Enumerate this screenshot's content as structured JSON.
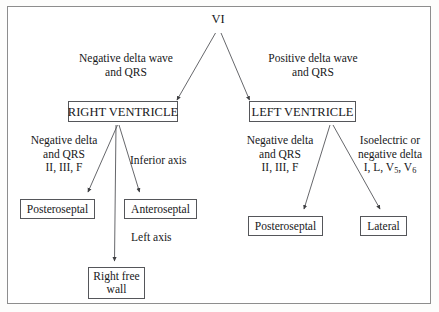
{
  "diagram": {
    "title": "VI",
    "root": {
      "id": "root",
      "label": "VI"
    },
    "level1_edge_labels": {
      "left_line1": "Negative delta wave",
      "left_line2": "and QRS",
      "right_line1": "Positive delta wave",
      "right_line2": "and QRS"
    },
    "level1_nodes": {
      "left": "RIGHT VENTRICLE",
      "right": "LEFT VENTRICLE"
    },
    "rv_branches": {
      "posteroseptal_label_line1": "Negative delta",
      "posteroseptal_label_line2": "and QRS",
      "posteroseptal_label_line3": "II, III, F",
      "anteroseptal_label": "Inferior axis",
      "right_free_wall_label": "Left axis"
    },
    "lv_branches": {
      "posteroseptal_label_line1": "Negative delta",
      "posteroseptal_label_line2": "and QRS",
      "posteroseptal_label_line3": "II, III, F",
      "lateral_label_line1": "Isoelectric or",
      "lateral_label_line2": "negative delta",
      "lateral_label_line3_pre": "I, L, V",
      "lateral_label_line3_sub1": "5",
      "lateral_label_line3_mid": ", V",
      "lateral_label_line3_sub2": "6"
    },
    "leaf_nodes": {
      "rv_posteroseptal": "Posteroseptal",
      "rv_anteroseptal": "Anteroseptal",
      "rv_right_free_wall_line1": "Right free",
      "rv_right_free_wall_line2": "wall",
      "lv_posteroseptal": "Posteroseptal",
      "lv_lateral": "Lateral"
    },
    "colors": {
      "line": "#55565a",
      "text": "#17181a",
      "frame": "#8d8d8d",
      "background": "#ffffff"
    }
  }
}
